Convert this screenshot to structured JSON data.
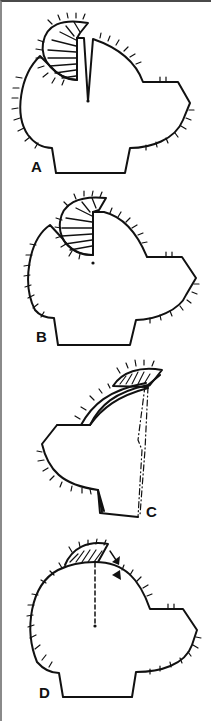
{
  "figure": {
    "panels": [
      {
        "id": "A",
        "label": "A",
        "description": "Head outline with flap incised at vertex; V-shaped incision to center point"
      },
      {
        "id": "B",
        "label": "B",
        "description": "Flap rotated; straight incision line to center point"
      },
      {
        "id": "C",
        "label": "C",
        "description": "Lateral view with flap on top; dash-dot lines"
      },
      {
        "id": "D",
        "label": "D",
        "description": "Flap advanced along top; dashed line to center point with arrows"
      }
    ],
    "colors": {
      "stroke": "#111111",
      "frame_top": "#4a4a4a",
      "frame_left": "#8a8a8a",
      "background": "#ffffff"
    }
  }
}
